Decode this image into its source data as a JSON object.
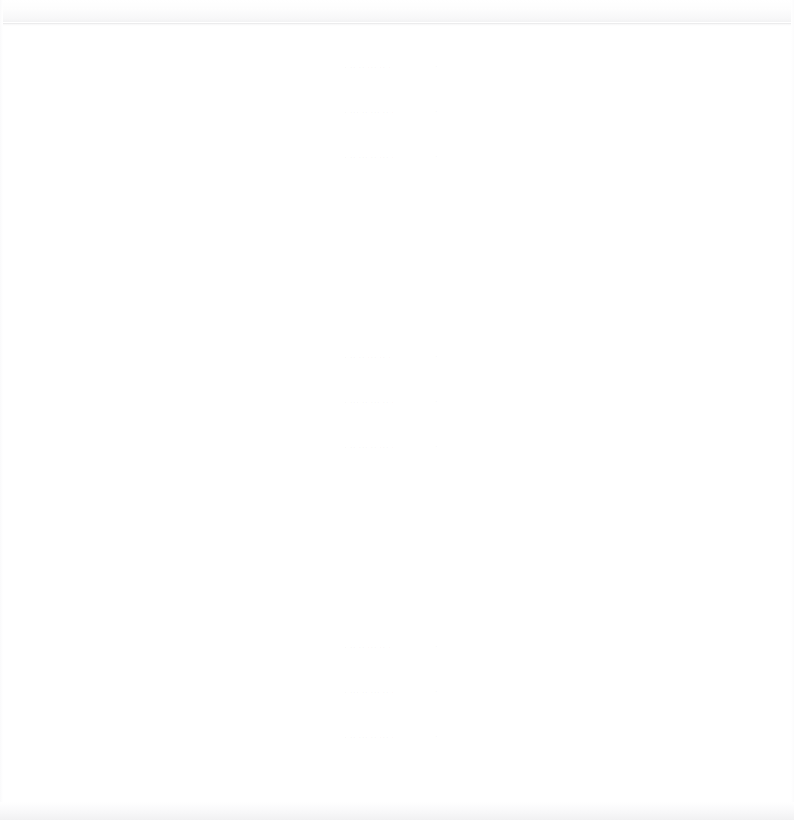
{
  "page": {
    "width": 794,
    "height": 820,
    "background_color": "#ffffff",
    "ink_color": "#6e707c",
    "rule_color": "#ececed"
  },
  "header": {
    "divider_label": "horizontal rule"
  },
  "footer": {
    "edge_label": "page bottom edge"
  },
  "blocks": [
    {
      "id": "block-1",
      "top": 62,
      "lines": [
        {
          "text": "· ·· ·· ··· ·· ·",
          "mark": "·",
          "dot": "·"
        },
        {
          "text": "· ··· ·· ··· ·· ·",
          "mark": "·",
          "dot": "·"
        },
        {
          "text": "· ·· ··· ·· ··· ·",
          "mark": "·",
          "dot": "·"
        }
      ]
    },
    {
      "id": "block-2",
      "top": 352,
      "lines": [
        {
          "text": "· ·· ·· ··· ·· ·",
          "mark": "·",
          "dot": "·"
        },
        {
          "text": "· ··· ·· ··· ·· ·",
          "mark": "·",
          "dot": "·"
        },
        {
          "text": "· ·· ··· ·· ··· ·",
          "mark": "·",
          "dot": "·"
        }
      ]
    },
    {
      "id": "block-3",
      "top": 642,
      "lines": [
        {
          "text": "· ·· ·· ··· ·· ·",
          "mark": "·",
          "dot": "·"
        },
        {
          "text": "· ··· ·· ··· ·· ·",
          "mark": "·",
          "dot": "·"
        },
        {
          "text": "· ·· ··· ·· ··· ·",
          "mark": "·",
          "dot": "·"
        }
      ]
    }
  ]
}
